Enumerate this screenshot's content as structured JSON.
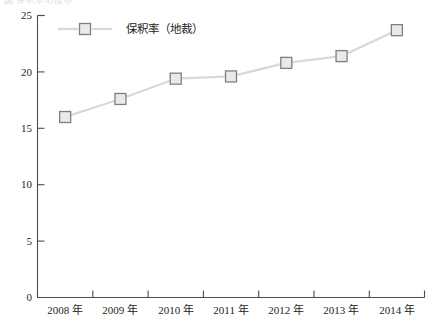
{
  "figure": {
    "cropped_caption": "図 保釈率の推移",
    "background_color": "#ffffff"
  },
  "chart_data": {
    "type": "line",
    "title": "",
    "xlabel": "",
    "ylabel": "",
    "categories": [
      "2008 年",
      "2009 年",
      "2010 年",
      "2011 年",
      "2012 年",
      "2013 年",
      "2014 年"
    ],
    "series": [
      {
        "name": "保釈率（地裁）",
        "values": [
          16.0,
          17.6,
          19.4,
          19.6,
          20.8,
          21.4,
          23.7
        ],
        "line_color": "#d8d8d8",
        "marker_shape": "square",
        "marker_edge_color": "#7f7f7f",
        "marker_face_color": "#e9e9e9"
      }
    ],
    "ylim": [
      0,
      25
    ],
    "yticks": [
      0,
      5,
      10,
      15,
      20,
      25
    ],
    "ytick_labels": [
      "0",
      "5",
      "10",
      "15",
      "20",
      "25"
    ],
    "grid": false,
    "legend_position": "top-left-inside",
    "axis_color": "#4d4d4d"
  },
  "legend": {
    "entries": [
      {
        "label": "保釈率（地裁）"
      }
    ]
  }
}
